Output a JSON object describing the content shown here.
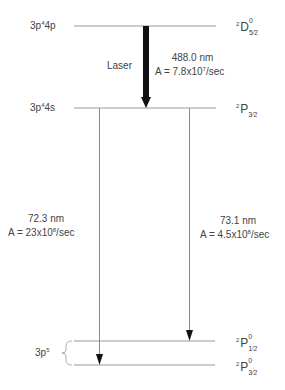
{
  "levels": [
    {
      "config": "3p",
      "config_sup": "4",
      "config_tail": "4p",
      "term_pre": "2",
      "term_letter": "D",
      "term_sup": "0",
      "term_sub": "5⁄2",
      "y": 26
    },
    {
      "config": "3p",
      "config_sup": "4",
      "config_tail": "4s",
      "term_pre": "2",
      "term_letter": "P",
      "term_sup": "",
      "term_sub": "3⁄2",
      "y": 108
    },
    {
      "config": "",
      "config_sup": "",
      "config_tail": "",
      "term_pre": "2",
      "term_letter": "P",
      "term_sup": "0",
      "term_sub": "1⁄2",
      "y": 340
    },
    {
      "config": "",
      "config_sup": "",
      "config_tail": "",
      "term_pre": "2",
      "term_letter": "P",
      "term_sup": "0",
      "term_sub": "3⁄2",
      "y": 365
    }
  ],
  "ground_config": {
    "base": "3p",
    "sup": "5"
  },
  "transitions": [
    {
      "label": "Laser",
      "wavelength": "488.0 nm",
      "rate_prefix": "A = 7.8x10",
      "rate_exp": "7",
      "rate_suffix": "/sec"
    },
    {
      "wavelength": "72.3 nm",
      "rate_prefix": "A = 23x10",
      "rate_exp": "8",
      "rate_suffix": "/sec"
    },
    {
      "wavelength": "73.1 nm",
      "rate_prefix": "A = 4.5x10",
      "rate_exp": "8",
      "rate_suffix": "/sec"
    }
  ],
  "colors": {
    "line": "#9a9a9a",
    "laser_arrow": "#111111",
    "text": "#444444"
  }
}
